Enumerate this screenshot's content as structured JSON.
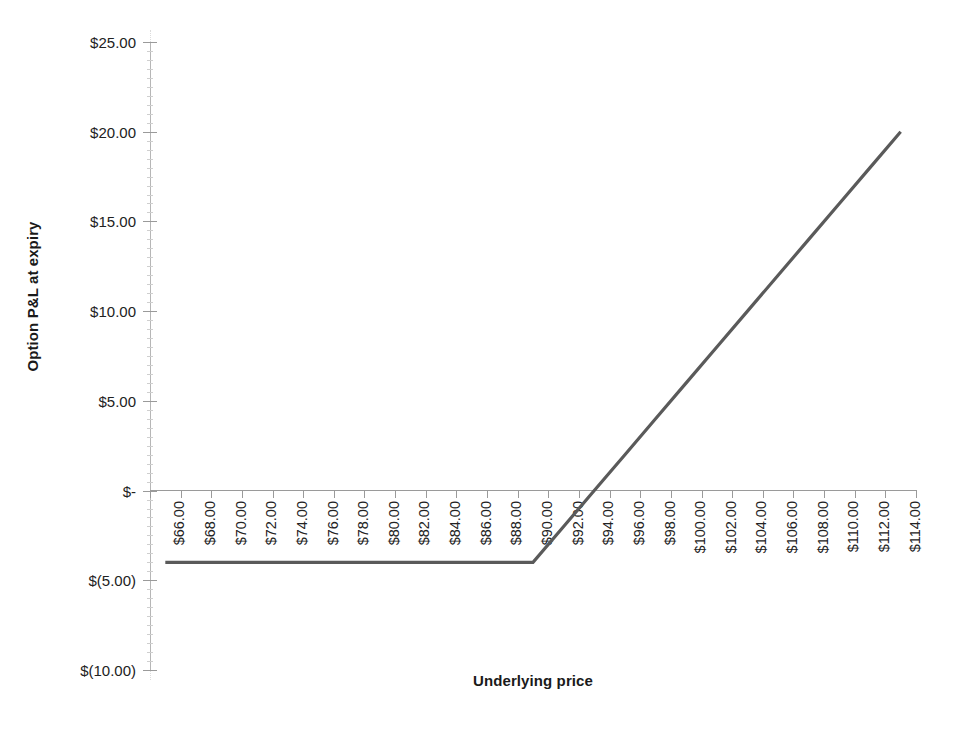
{
  "chart_data": {
    "type": "line",
    "title": "",
    "xlabel": "Underlying price",
    "ylabel": "Option P&L at expiry",
    "grid": false,
    "legend": "none",
    "xlim": [
      66,
      114
    ],
    "ylim": [
      -10,
      25
    ],
    "x_tick_step": 2,
    "y_tick_step": 5,
    "strike": 90,
    "premium": 4,
    "x_tick_labels": [
      "$66.00",
      "$68.00",
      "$70.00",
      "$72.00",
      "$74.00",
      "$76.00",
      "$78.00",
      "$80.00",
      "$82.00",
      "$84.00",
      "$86.00",
      "$88.00",
      "$90.00",
      "$92.00",
      "$94.00",
      "$96.00",
      "$98.00",
      "$100.00",
      "$102.00",
      "$104.00",
      "$106.00",
      "$108.00",
      "$110.00",
      "$112.00",
      "$114.00"
    ],
    "y_tick_labels": [
      "$25.00",
      "$20.00",
      "$15.00",
      "$10.00",
      "$5.00",
      "$-",
      "$(5.00)",
      "$(10.00)"
    ],
    "y_tick_values": [
      25,
      20,
      15,
      10,
      5,
      0,
      -5,
      -10
    ],
    "x": [
      66,
      68,
      70,
      72,
      74,
      76,
      78,
      80,
      82,
      84,
      86,
      88,
      90,
      92,
      94,
      96,
      98,
      100,
      102,
      104,
      106,
      108,
      110,
      112,
      114
    ],
    "series": [
      {
        "name": "Option P&L at expiry",
        "color": "#5a5a5a",
        "values": [
          -4,
          -4,
          -4,
          -4,
          -4,
          -4,
          -4,
          -4,
          -4,
          -4,
          -4,
          -4,
          -4,
          -2,
          0,
          2,
          4,
          6,
          8,
          10,
          12,
          14,
          16,
          18,
          20
        ]
      }
    ]
  },
  "axis": {
    "line_color": "#9a9a9a",
    "tick_color": "#9a9a9a"
  }
}
